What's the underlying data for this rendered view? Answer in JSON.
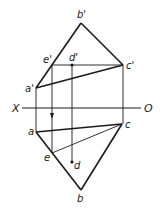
{
  "diagram": {
    "type": "orthographic-projection",
    "axis": {
      "left_label": "X",
      "right_label": "O"
    },
    "front_view": {
      "points": {
        "b_prime": {
          "label": "b'",
          "x": 81,
          "y": 23
        },
        "e_prime": {
          "label": "e'",
          "x": 52,
          "y": 65
        },
        "d_prime": {
          "label": "d'",
          "x": 72,
          "y": 65
        },
        "c_prime": {
          "label": "c'",
          "x": 123,
          "y": 65
        },
        "a_prime": {
          "label": "a'",
          "x": 36,
          "y": 88
        }
      }
    },
    "top_view": {
      "points": {
        "a": {
          "label": "a",
          "x": 36,
          "y": 132
        },
        "c": {
          "label": "c",
          "x": 122,
          "y": 124
        },
        "e": {
          "label": "e",
          "x": 52,
          "y": 153
        },
        "d": {
          "label": "d",
          "x": 72,
          "y": 162
        },
        "b": {
          "label": "b",
          "x": 81,
          "y": 190
        }
      }
    },
    "colors": {
      "line": "#1a1a1a",
      "background": "#ffffff"
    }
  }
}
